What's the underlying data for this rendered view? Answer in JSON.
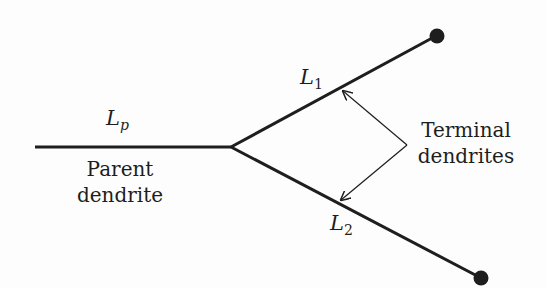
{
  "diagram": {
    "labels": {
      "lp": "L",
      "lp_sub": "p",
      "l1": "L",
      "l1_sub": "1",
      "l2": "L",
      "l2_sub": "2",
      "parent_line1": "Parent",
      "parent_line2": "dendrite",
      "terminal_line1": "Terminal",
      "terminal_line2": "dendrites"
    },
    "colors": {
      "stroke": "#1e1e1e",
      "background": "#fdfdfd"
    }
  }
}
